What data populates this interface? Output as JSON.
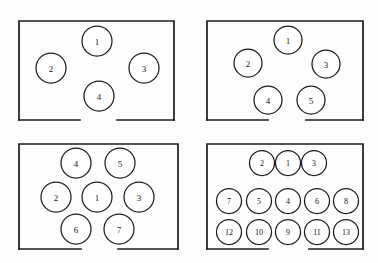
{
  "figure": {
    "width": 378,
    "height": 263,
    "background_color": "#fdfdfc",
    "line_color": "#1c1c1c",
    "circle_fill": "#ffffff",
    "title": "",
    "caption": ""
  },
  "panels": [
    {
      "id": "panel-top-left",
      "position": "top-left",
      "seat_count": 4,
      "frame": {
        "x": 19,
        "y": 21,
        "width": 155,
        "height": 99
      },
      "opening": {
        "edge": "bottom",
        "x_start": 80,
        "x_end": 117
      },
      "seats": [
        {
          "label": "1",
          "cx": 97,
          "cy": 41,
          "r": 15,
          "font_size": 9
        },
        {
          "label": "2",
          "cx": 51,
          "cy": 68,
          "r": 15,
          "font_size": 9
        },
        {
          "label": "3",
          "cx": 144,
          "cy": 68,
          "r": 15,
          "font_size": 9
        },
        {
          "label": "4",
          "cx": 99,
          "cy": 96,
          "r": 15,
          "font_size": 9
        }
      ]
    },
    {
      "id": "panel-top-right",
      "position": "top-right",
      "seat_count": 5,
      "frame": {
        "x": 207,
        "y": 21,
        "width": 156,
        "height": 99
      },
      "opening": {
        "edge": "bottom",
        "x_start": 268,
        "x_end": 306
      },
      "seats": [
        {
          "label": "1",
          "cx": 288,
          "cy": 40,
          "r": 14,
          "font_size": 9
        },
        {
          "label": "2",
          "cx": 248,
          "cy": 63,
          "r": 14,
          "font_size": 9
        },
        {
          "label": "3",
          "cx": 326,
          "cy": 64,
          "r": 14,
          "font_size": 9
        },
        {
          "label": "4",
          "cx": 268,
          "cy": 100,
          "r": 14,
          "font_size": 9
        },
        {
          "label": "5",
          "cx": 311,
          "cy": 100,
          "r": 14,
          "font_size": 9
        }
      ]
    },
    {
      "id": "panel-bottom-left",
      "position": "bottom-left",
      "seat_count": 7,
      "frame": {
        "x": 19,
        "y": 144,
        "width": 159,
        "height": 105
      },
      "opening": {
        "edge": "bottom",
        "x_start": 81,
        "x_end": 118
      },
      "seats": [
        {
          "label": "4",
          "cx": 76,
          "cy": 163,
          "r": 15,
          "font_size": 9
        },
        {
          "label": "5",
          "cx": 120,
          "cy": 163,
          "r": 15,
          "font_size": 9
        },
        {
          "label": "2",
          "cx": 56,
          "cy": 197,
          "r": 15,
          "font_size": 9
        },
        {
          "label": "1",
          "cx": 97,
          "cy": 197,
          "r": 15,
          "font_size": 9
        },
        {
          "label": "3",
          "cx": 139,
          "cy": 197,
          "r": 15,
          "font_size": 9
        },
        {
          "label": "6",
          "cx": 76,
          "cy": 229,
          "r": 15,
          "font_size": 9
        },
        {
          "label": "7",
          "cx": 119,
          "cy": 229,
          "r": 15,
          "font_size": 9
        }
      ]
    },
    {
      "id": "panel-bottom-right",
      "position": "bottom-right",
      "seat_count": 13,
      "frame": {
        "x": 207,
        "y": 144,
        "width": 156,
        "height": 105
      },
      "opening": {
        "edge": "bottom",
        "x_start": 268,
        "x_end": 309
      },
      "seats": [
        {
          "label": "2",
          "cx": 262,
          "cy": 163,
          "r": 12.5,
          "font_size": 8
        },
        {
          "label": "1",
          "cx": 288,
          "cy": 163,
          "r": 12.5,
          "font_size": 8
        },
        {
          "label": "3",
          "cx": 314,
          "cy": 163,
          "r": 12.5,
          "font_size": 8
        },
        {
          "label": "7",
          "cx": 229,
          "cy": 201,
          "r": 12.5,
          "font_size": 8
        },
        {
          "label": "5",
          "cx": 259,
          "cy": 201,
          "r": 12.5,
          "font_size": 8
        },
        {
          "label": "4",
          "cx": 288,
          "cy": 201,
          "r": 12.5,
          "font_size": 8
        },
        {
          "label": "6",
          "cx": 317,
          "cy": 201,
          "r": 12.5,
          "font_size": 8
        },
        {
          "label": "8",
          "cx": 346,
          "cy": 201,
          "r": 12.5,
          "font_size": 8
        },
        {
          "label": "12",
          "cx": 229,
          "cy": 232,
          "r": 12.5,
          "font_size": 8
        },
        {
          "label": "10",
          "cx": 259,
          "cy": 232,
          "r": 12.5,
          "font_size": 8
        },
        {
          "label": "9",
          "cx": 288,
          "cy": 232,
          "r": 12.5,
          "font_size": 8
        },
        {
          "label": "11",
          "cx": 317,
          "cy": 232,
          "r": 12.5,
          "font_size": 8
        },
        {
          "label": "13",
          "cx": 346,
          "cy": 232,
          "r": 12.5,
          "font_size": 8
        }
      ]
    }
  ]
}
